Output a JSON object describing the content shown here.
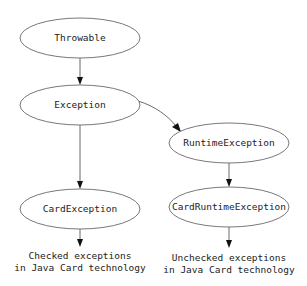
{
  "diagram": {
    "nodes": [
      {
        "id": "throwable",
        "label": "Throwable",
        "cx": 80,
        "cy": 38,
        "rx": 60,
        "ry": 20
      },
      {
        "id": "exception",
        "label": "Exception",
        "cx": 80,
        "cy": 105,
        "rx": 60,
        "ry": 20
      },
      {
        "id": "runtime_exception",
        "label": "RuntimeException",
        "cx": 229,
        "cy": 143,
        "rx": 60,
        "ry": 20
      },
      {
        "id": "card_exception",
        "label": "CardException",
        "cx": 80,
        "cy": 209,
        "rx": 60,
        "ry": 20
      },
      {
        "id": "card_runtime_exception",
        "label": "CardRuntimeException",
        "cx": 229,
        "cy": 207,
        "rx": 60,
        "ry": 20
      }
    ],
    "edges": [
      {
        "from": "throwable",
        "to": "exception"
      },
      {
        "from": "exception",
        "to": "runtime_exception"
      },
      {
        "from": "exception",
        "to": "card_exception"
      },
      {
        "from": "runtime_exception",
        "to": "card_runtime_exception"
      },
      {
        "from": "card_exception",
        "to": "checked_label"
      },
      {
        "from": "card_runtime_exception",
        "to": "unchecked_label"
      }
    ],
    "labels": {
      "checked": {
        "line1": "Checked exceptions",
        "line2": "in Java Card technology"
      },
      "unchecked": {
        "line1": "Unchecked exceptions",
        "line2": "in Java Card technology"
      }
    }
  },
  "colors": {
    "stroke": "#555555",
    "text": "#222222",
    "background": "#ffffff"
  }
}
